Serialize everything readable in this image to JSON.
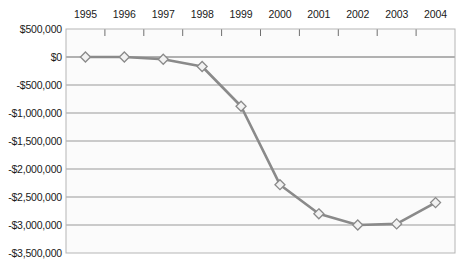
{
  "chart_data": {
    "type": "line",
    "title": "",
    "subtitle": "",
    "xlabel": "",
    "ylabel": "",
    "categories": [
      "1995",
      "1996",
      "1997",
      "1998",
      "1999",
      "2000",
      "2001",
      "2002",
      "2003",
      "2004"
    ],
    "values": [
      0,
      0,
      -40000,
      -170000,
      -880000,
      -2280000,
      -2800000,
      -3000000,
      -2980000,
      -2600000
    ],
    "series": [
      {
        "name": "",
        "values": [
          0,
          0,
          -40000,
          -170000,
          -880000,
          -2280000,
          -2800000,
          -3000000,
          -2980000,
          -2600000
        ]
      }
    ],
    "ylim": [
      -3500000,
      500000
    ],
    "ytick_values": [
      500000,
      0,
      -500000,
      -1000000,
      -1500000,
      -2000000,
      -2500000,
      -3000000,
      -3500000
    ],
    "ytick_labels": [
      "$500,000",
      "$0",
      "-$500,000",
      "-$1,000,000",
      "-$1,500,000",
      "-$2,000,000",
      "-$2,500,000",
      "-$3,000,000",
      "-$3,500,000"
    ],
    "xtick_labels": [
      "1995",
      "1996",
      "1997",
      "1998",
      "1999",
      "2000",
      "2001",
      "2002",
      "2003",
      "2004"
    ],
    "grid": true,
    "grid_axis": "y",
    "legend": false,
    "legend_position": "none",
    "annotations": [],
    "marker": "diamond",
    "colors": {
      "line": "#8a8a8a",
      "marker_fill": "#f2f2f2",
      "marker_edge": "#8a8a8a",
      "gridline": "#999999",
      "plot_background": "#fbfbfb",
      "plot_border": "#b5b5b5",
      "text": "#1a1a1a"
    }
  },
  "plot": {
    "left": 66,
    "right": 455,
    "top": 29,
    "bottom": 253
  }
}
